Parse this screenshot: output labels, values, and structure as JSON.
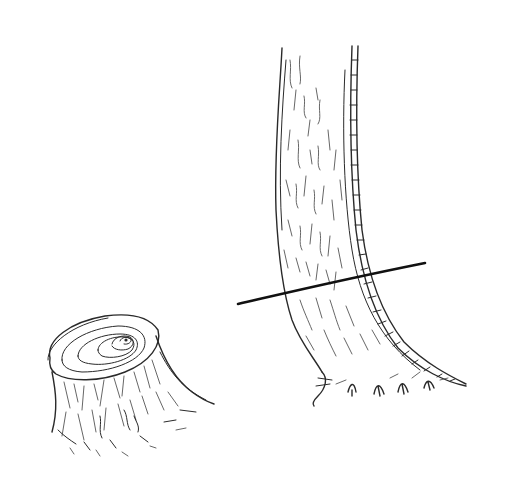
{
  "scene": {
    "description": "Pencil sketch: a cut tree stump and a standing tree trunk marked with a cutting line",
    "background": "#ffffff",
    "ink_color": "#2a2a2a",
    "cut_line_color": "#111111"
  },
  "objects": [
    {
      "name": "tree-stump",
      "caption": ""
    },
    {
      "name": "tree-trunk",
      "caption": ""
    },
    {
      "name": "cut-line",
      "caption": "",
      "from": [
        238,
        304
      ],
      "to": [
        425,
        263
      ]
    }
  ]
}
